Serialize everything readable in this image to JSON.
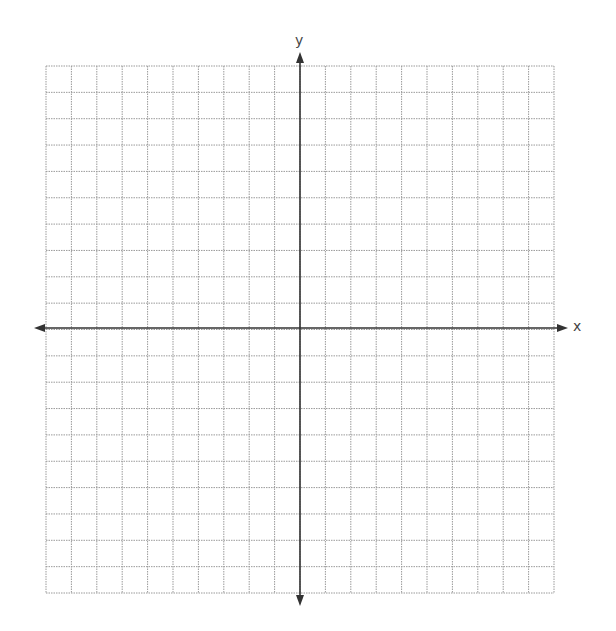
{
  "diagram": {
    "type": "coordinate-plane",
    "grid": {
      "columns": 20,
      "rows": 20,
      "left": 46,
      "top": 66,
      "right": 554,
      "bottom": 593,
      "line_color": "#9a9a9a",
      "line_style": "dotted"
    },
    "axes": {
      "origin": {
        "x": 300,
        "y": 328
      },
      "color": "#333333",
      "x_axis": {
        "label": "x",
        "from": 34,
        "to": 568
      },
      "y_axis": {
        "label": "y",
        "from": 52,
        "to": 606
      }
    }
  }
}
